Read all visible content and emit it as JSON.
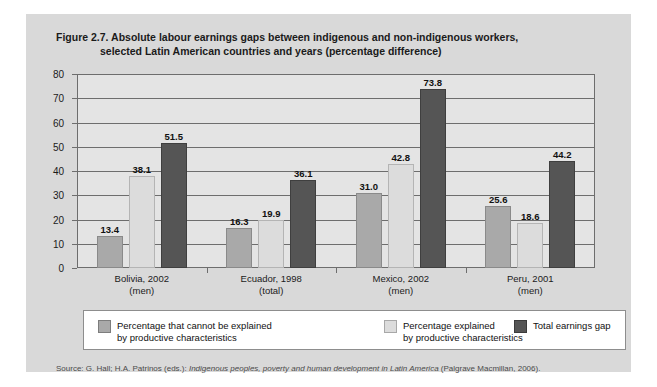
{
  "figure": {
    "title_line1": "Figure 2.7.  Absolute labour earnings gaps between indigenous and non-indigenous workers,",
    "title_line2": "selected Latin American countries and years (percentage difference)",
    "source_prefix": "Source: G. Hall; H.A. Patrinos (eds.): ",
    "source_italic": "Indigenous peoples, poverty and human development in Latin America",
    "source_suffix": " (Palgrave Macmillan, 2006)."
  },
  "legend": {
    "items": [
      {
        "label_line1": "Percentage that cannot be explained",
        "label_line2": "by productive characteristics",
        "color": "#a9a9a9"
      },
      {
        "label_line1": "Percentage explained",
        "label_line2": "by productive characteristics",
        "color": "#dcdcdc"
      },
      {
        "label_line1": "Total earnings gap",
        "label_line2": "",
        "color": "#555555"
      }
    ]
  },
  "chart_data": {
    "type": "bar",
    "title": "Figure 2.7.  Absolute labour earnings gaps between indigenous and non-indigenous workers, selected Latin American countries and years (percentage difference)",
    "xlabel": "",
    "ylabel": "",
    "ylim": [
      0,
      80
    ],
    "yticks": [
      0,
      10,
      20,
      30,
      40,
      50,
      60,
      70,
      80
    ],
    "ytick_labels": [
      "0",
      "10",
      "20",
      "30",
      "40",
      "50",
      "60",
      "70",
      "80"
    ],
    "grid": true,
    "legend_position": "bottom",
    "categories": [
      "Bolivia, 2002",
      "Ecuador, 1998",
      "Mexico, 2002",
      "Peru, 2001"
    ],
    "category_sublabels": [
      "(men)",
      "(total)",
      "(men)",
      "(men)"
    ],
    "series": [
      {
        "name": "Percentage that cannot be explained by productive characteristics",
        "color": "#a9a9a9",
        "values": [
          13.4,
          16.3,
          31.0,
          25.6
        ],
        "labels": [
          "13.4",
          "16.3",
          "31.0",
          "25.6"
        ]
      },
      {
        "name": "Percentage explained by productive characteristics",
        "color": "#dcdcdc",
        "values": [
          38.1,
          19.9,
          42.8,
          18.6
        ],
        "labels": [
          "38.1",
          "19.9",
          "42.8",
          "18.6"
        ]
      },
      {
        "name": "Total earnings gap",
        "color": "#555555",
        "values": [
          51.5,
          36.1,
          73.8,
          44.2
        ],
        "labels": [
          "51.5",
          "36.1",
          "73.8",
          "44.2"
        ]
      }
    ]
  }
}
